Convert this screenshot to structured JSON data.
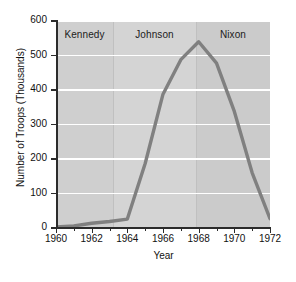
{
  "chart_data": {
    "type": "line",
    "title": "",
    "xlabel": "Year",
    "ylabel": "Number of Troops (Thousands)",
    "xlim": [
      1960,
      1972
    ],
    "ylim": [
      0,
      600
    ],
    "grid": true,
    "legend": "none",
    "x": [
      1960,
      1961,
      1962,
      1963,
      1964,
      1965,
      1966,
      1967,
      1968,
      1969,
      1970,
      1971,
      1972
    ],
    "series": [
      {
        "name": "U.S. Troops in Vietnam",
        "color": "#808080",
        "values": [
          0,
          3,
          11,
          16,
          23,
          184,
          385,
          485,
          537,
          475,
          335,
          157,
          24
        ]
      }
    ],
    "x_tick_labels": [
      "1960",
      "1962",
      "1964",
      "1966",
      "1968",
      "1970",
      "1972"
    ],
    "x_tick_values": [
      1960,
      1962,
      1964,
      1966,
      1968,
      1970,
      1972
    ],
    "x_minor_tick_values": [
      1961,
      1963,
      1965,
      1967,
      1969,
      1971
    ],
    "y_tick_labels": [
      "0",
      "100",
      "200",
      "300",
      "400",
      "500",
      "600"
    ],
    "y_tick_values": [
      0,
      100,
      200,
      300,
      400,
      500,
      600
    ],
    "annotations": [
      {
        "label": "Kennedy",
        "start": 1960,
        "end": 1963.2,
        "shade": "#cfcfcf"
      },
      {
        "label": "Johnson",
        "start": 1963.2,
        "end": 1967.85,
        "shade": "#d4d4d4"
      },
      {
        "label": "Nixon",
        "start": 1967.85,
        "end": 1972,
        "shade": "#cbcbcb"
      }
    ]
  },
  "style": {
    "plot_background": "#d2d2d2",
    "gridline_color": "#ffffff",
    "axis_color": "#2b2b2b",
    "line_color": "#808080",
    "page_background": "#ffffff"
  }
}
